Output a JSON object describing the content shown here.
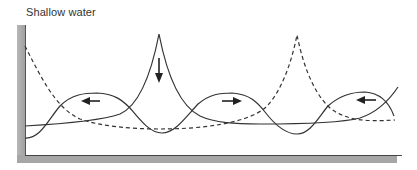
{
  "title": "Shallow water",
  "colors": {
    "frame": "#a8a8a8",
    "line": "#333333",
    "background": "#ffffff"
  },
  "diagram": {
    "curves": [
      {
        "name": "solid-wave-traveling",
        "style": "solid"
      },
      {
        "name": "solid-wave-peaked",
        "style": "solid"
      },
      {
        "name": "dashed-wave-peaked",
        "style": "dashed"
      }
    ],
    "arrows": [
      {
        "name": "arrow-left-1",
        "direction": "left"
      },
      {
        "name": "arrow-down",
        "direction": "down"
      },
      {
        "name": "arrow-right",
        "direction": "right"
      },
      {
        "name": "arrow-left-2",
        "direction": "left"
      }
    ]
  }
}
